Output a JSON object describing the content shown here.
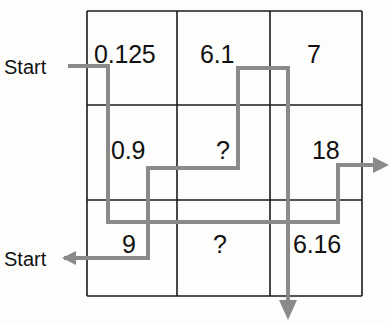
{
  "figure": {
    "type": "grid-flow-puzzle",
    "grid": {
      "rows": 3,
      "cols": 3,
      "cells": [
        [
          "0.125",
          "6.1",
          "7"
        ],
        [
          "0.9",
          "?",
          "18"
        ],
        [
          "9",
          "?",
          "6.16"
        ]
      ]
    },
    "labels": {
      "start_top": "Start",
      "start_bottom": "Start"
    },
    "colors": {
      "grid_line": "#1a1a1a",
      "path_line": "#8a8a8a",
      "text": "#111111",
      "background": "#fdfdfc"
    }
  }
}
